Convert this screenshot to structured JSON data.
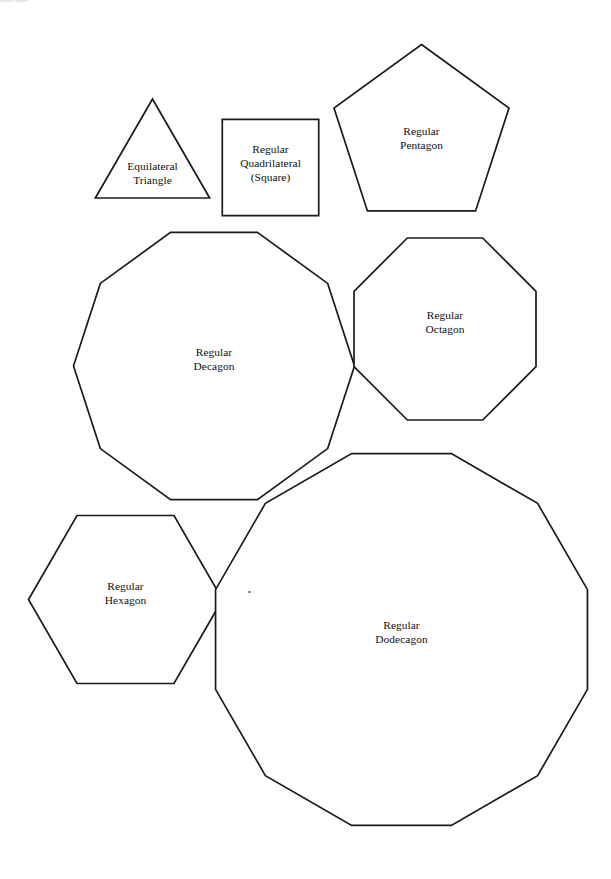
{
  "page": {
    "width": 611,
    "height": 879,
    "background_color": "#ffffff",
    "stroke_color": "#1a1a1a",
    "label_color": "#100f12",
    "header_text": "Regular Polygons"
  },
  "figure": {
    "shapes": [
      {
        "id": "equilateral-triangle",
        "sides": 3,
        "label_lines": [
          "Equilateral",
          "Triangle"
        ],
        "center_x": 152.5,
        "center_y": 165.0,
        "radius": 66.0,
        "rotation_deg": -90,
        "label_x": 152.5,
        "label_y": 170.0
      },
      {
        "id": "regular-quadrilateral",
        "sides": 4,
        "label_lines": [
          "Regular",
          "Quadrilateral",
          "(Square)"
        ],
        "center_x": 270.5,
        "center_y": 167.5,
        "radius": 68.2,
        "rotation_deg": 45,
        "label_x": 270.5,
        "label_y": 153.0
      },
      {
        "id": "regular-pentagon",
        "sides": 5,
        "label_lines": [
          "Regular",
          "Pentagon"
        ],
        "center_x": 421.5,
        "center_y": 136.5,
        "radius": 92.0,
        "rotation_deg": -90,
        "label_x": 421.5,
        "label_y": 135.0
      },
      {
        "id": "regular-decagon",
        "sides": 10,
        "label_lines": [
          "Regular",
          "Decagon"
        ],
        "center_x": 214.0,
        "center_y": 366.0,
        "radius": 140.5,
        "rotation_deg": -72,
        "label_x": 214.0,
        "label_y": 356.0
      },
      {
        "id": "regular-octagon",
        "sides": 8,
        "label_lines": [
          "Regular",
          "Octagon"
        ],
        "center_x": 445.0,
        "center_y": 329.0,
        "radius": 98.5,
        "rotation_deg": -67.5,
        "label_x": 445.0,
        "label_y": 319.0
      },
      {
        "id": "regular-hexagon",
        "sides": 6,
        "label_lines": [
          "Regular",
          "Hexagon"
        ],
        "center_x": 125.5,
        "center_y": 599.5,
        "radius": 97.0,
        "rotation_deg": 0,
        "label_x": 125.5,
        "label_y": 590.0
      },
      {
        "id": "regular-dodecagon",
        "sides": 12,
        "label_lines": [
          "Regular",
          "Dodecagon"
        ],
        "center_x": 401.5,
        "center_y": 639.5,
        "radius": 192.5,
        "rotation_deg": -75,
        "label_x": 401.5,
        "label_y": 629.0
      }
    ],
    "specks": [
      {
        "id": "speck-1",
        "x": 249.5,
        "y": 592.0,
        "r": 1.1
      }
    ]
  }
}
